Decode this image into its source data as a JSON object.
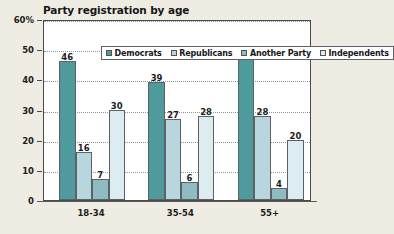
{
  "chart_data": {
    "type": "bar",
    "title": "Party registration by age",
    "xlabel": "",
    "ylabel": "",
    "ylim": [
      0,
      60
    ],
    "grid": true,
    "legend_position": "top-inside",
    "categories": [
      "18-34",
      "35-54",
      "55+"
    ],
    "y_ticks": [
      "0",
      "10",
      "20",
      "30",
      "40",
      "50",
      "60%"
    ],
    "y_tick_values": [
      0,
      10,
      20,
      30,
      40,
      50,
      60
    ],
    "series": [
      {
        "name": "Democrats",
        "color": "#4f9a9c",
        "values": [
          46,
          39,
          48
        ]
      },
      {
        "name": "Republicans",
        "color": "#b7d6de",
        "values": [
          16,
          27,
          28
        ]
      },
      {
        "name": "Another Party",
        "color": "#8fbcc2",
        "values": [
          7,
          6,
          4
        ]
      },
      {
        "name": "Independents",
        "color": "#dcecf1",
        "values": [
          30,
          28,
          20
        ]
      }
    ]
  },
  "legend": {
    "items": [
      {
        "label": "Democrats",
        "color": "#4f9a9c"
      },
      {
        "label": "Republicans",
        "color": "#b7d6de"
      },
      {
        "label": "Another Party",
        "color": "#8fbcc2"
      },
      {
        "label": "Independents",
        "color": "#dcecf1"
      }
    ]
  },
  "colors": {
    "background": "#efece3",
    "plot_background": "#ffffff",
    "axis": "#4a4a4a",
    "gridline": "#8d9aa3",
    "text": "#1d1d20"
  }
}
